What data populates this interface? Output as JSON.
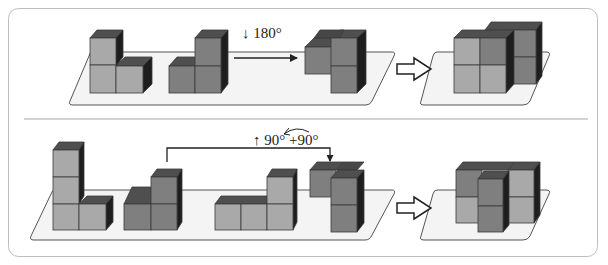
{
  "diagram": {
    "colors": {
      "panel_border": "#b9b9b9",
      "platform_fill": "#f3f3f3",
      "platform_stroke": "#555555",
      "cube_light": "#a9a9a9",
      "cube_mid": "#7f7f7f",
      "cube_top": "#4f4f4f",
      "cube_side": "#1e1e1e",
      "edge": "#3a3a3a",
      "arrow": "#222222"
    },
    "rows": [
      {
        "id": "top",
        "rotation_label": "↓ 180°",
        "steps": [
          "piece-light-L",
          "piece-dark-L",
          "rotated-dark-piece",
          "hollow-arrow",
          "assembled-result"
        ]
      },
      {
        "id": "bottom",
        "rotation_label": "↑ 90° +90°",
        "rotation_label_parts": [
          "↑",
          "90°",
          "+90°"
        ],
        "steps": [
          "piece-light-tall-L",
          "piece-dark-L",
          "piece-light-long-L",
          "rotated-dark-piece",
          "hollow-arrow",
          "assembled-result"
        ]
      }
    ]
  }
}
